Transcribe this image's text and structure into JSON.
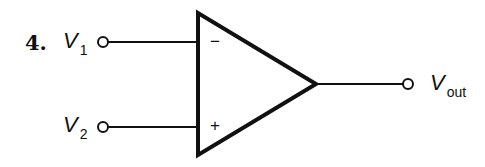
{
  "problem": {
    "number": "4."
  },
  "inputs": [
    {
      "name": "V",
      "subscript": "1",
      "terminal": "inverting",
      "sign": "−"
    },
    {
      "name": "V",
      "subscript": "2",
      "terminal": "non-inverting",
      "sign": "+"
    }
  ],
  "output": {
    "name": "V",
    "subscript": "out"
  },
  "component": "op-amp",
  "colors": {
    "stroke": "#111111",
    "background": "#ffffff"
  }
}
